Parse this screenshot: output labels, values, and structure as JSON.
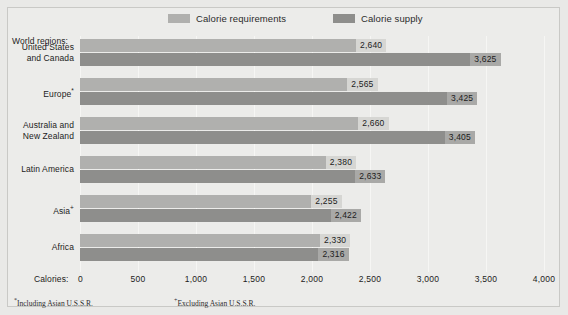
{
  "legend": {
    "items": [
      {
        "label": "Calorie requirements",
        "color": "#b0b0ae",
        "key": "requirements"
      },
      {
        "label": "Calorie supply",
        "color": "#8e8e8c",
        "key": "supply"
      }
    ]
  },
  "axes": {
    "y_title": "World regions:",
    "x_title": "Calories:",
    "x_ticks": [
      "0",
      "500",
      "1,000",
      "1,500",
      "2,000",
      "2,500",
      "3,000",
      "3,500",
      "4,000"
    ]
  },
  "footnotes": [
    {
      "marker": "*",
      "text": "Including Asian U.S.S.R."
    },
    {
      "marker": "+",
      "text": "Excluding Asian U.S.S.R."
    }
  ],
  "chart_data": {
    "type": "bar",
    "orientation": "horizontal",
    "title": "",
    "xlabel": "Calories:",
    "ylabel": "World regions:",
    "xlim": [
      0,
      4000
    ],
    "grid": true,
    "legend_position": "top",
    "categories": [
      "United States and Canada",
      "Europe*",
      "Australia and New Zealand",
      "Latin America",
      "Asia+",
      "Africa"
    ],
    "category_lines": [
      [
        "United States",
        "and Canada"
      ],
      [
        "Europe*"
      ],
      [
        "Australia and",
        "New Zealand"
      ],
      [
        "Latin America"
      ],
      [
        "Asia+"
      ],
      [
        "Africa"
      ]
    ],
    "series": [
      {
        "name": "Calorie requirements",
        "color": "#b0b0ae",
        "values": [
          2640,
          2565,
          2660,
          2380,
          2255,
          2330
        ],
        "labels": [
          "2,640",
          "2,565",
          "2,660",
          "2,380",
          "2,255",
          "2,330"
        ]
      },
      {
        "name": "Calorie supply",
        "color": "#8e8e8c",
        "values": [
          3625,
          3425,
          3405,
          2633,
          2422,
          2316
        ],
        "labels": [
          "3,625",
          "3,425",
          "3,405",
          "2,633",
          "2,422",
          "2,316"
        ]
      }
    ]
  }
}
